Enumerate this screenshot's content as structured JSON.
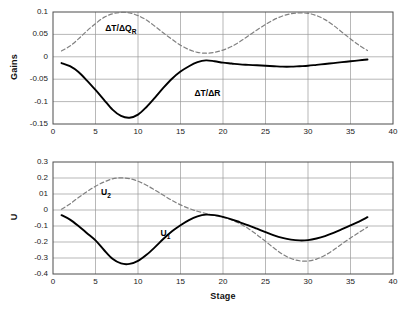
{
  "figure": {
    "background": "#ffffff",
    "grid_color": "#9a9a9a",
    "frame_color": "#4d4d4d",
    "solid_color": "#000000",
    "dashed_color": "#808080"
  },
  "chart_data": [
    {
      "type": "line",
      "panel": "top",
      "title": "",
      "xlabel": "",
      "ylabel": "Gains",
      "xlim": [
        0,
        40
      ],
      "ylim": [
        -0.15,
        0.1
      ],
      "xticks": [
        0,
        5,
        10,
        15,
        20,
        25,
        30,
        35,
        40
      ],
      "xticklabels": [
        "0",
        "5",
        "10",
        "15",
        "20",
        "25",
        "30",
        "35",
        "40"
      ],
      "yticks": [
        0.1,
        0.05,
        0,
        -0.05,
        -0.1,
        -0.15
      ],
      "yticklabels": [
        "0.1",
        "0.05",
        "0",
        "-0.05",
        "-0.1",
        "-0.15"
      ],
      "grid": true,
      "legend": "inline-annotations",
      "annotations": [
        {
          "text": "ΔT/ΔQ",
          "sub": "R",
          "x": 8.5,
          "y": 0.063
        },
        {
          "text": "ΔT/ΔR",
          "sub": "",
          "x": 19.0,
          "y": -0.082
        }
      ],
      "series": [
        {
          "name": "ΔT/ΔR",
          "style": "solid",
          "color": "#000000",
          "x": [
            1,
            2,
            3,
            4,
            5,
            6,
            7,
            8,
            9,
            10,
            11,
            12,
            13,
            14,
            15,
            16,
            17,
            18,
            19,
            20,
            21,
            22,
            23,
            24,
            25,
            26,
            27,
            28,
            29,
            30,
            31,
            32,
            33,
            34,
            35,
            36,
            37
          ],
          "y": [
            -0.014,
            -0.021,
            -0.034,
            -0.053,
            -0.074,
            -0.096,
            -0.118,
            -0.132,
            -0.136,
            -0.129,
            -0.112,
            -0.091,
            -0.069,
            -0.049,
            -0.033,
            -0.021,
            -0.012,
            -0.008,
            -0.01,
            -0.013,
            -0.015,
            -0.017,
            -0.018,
            -0.019,
            -0.02,
            -0.021,
            -0.022,
            -0.022,
            -0.021,
            -0.02,
            -0.018,
            -0.016,
            -0.014,
            -0.012,
            -0.01,
            -0.008,
            -0.006
          ]
        },
        {
          "name": "ΔT/ΔQ_R",
          "style": "dashed",
          "color": "#808080",
          "x": [
            1,
            2,
            3,
            4,
            5,
            6,
            7,
            8,
            9,
            10,
            11,
            12,
            13,
            14,
            15,
            16,
            17,
            18,
            19,
            20,
            21,
            22,
            23,
            24,
            25,
            26,
            27,
            28,
            29,
            30,
            31,
            32,
            33,
            34,
            35,
            36,
            37
          ],
          "y": [
            0.013,
            0.024,
            0.04,
            0.058,
            0.074,
            0.088,
            0.096,
            0.099,
            0.098,
            0.092,
            0.082,
            0.068,
            0.053,
            0.039,
            0.026,
            0.016,
            0.01,
            0.008,
            0.01,
            0.015,
            0.023,
            0.034,
            0.047,
            0.06,
            0.072,
            0.083,
            0.091,
            0.096,
            0.098,
            0.097,
            0.092,
            0.083,
            0.07,
            0.055,
            0.04,
            0.026,
            0.014
          ]
        }
      ]
    },
    {
      "type": "line",
      "panel": "bottom",
      "title": "",
      "xlabel": "Stage",
      "ylabel": "U",
      "xlim": [
        0,
        40
      ],
      "ylim": [
        -0.4,
        0.3
      ],
      "xticks": [
        0,
        5,
        10,
        15,
        20,
        25,
        30,
        35,
        40
      ],
      "xticklabels": [
        "0",
        "5",
        "10",
        "15",
        "20",
        "25",
        "30",
        "35",
        "40"
      ],
      "yticks": [
        0.3,
        0.2,
        0.1,
        0,
        -0.1,
        -0.2,
        -0.3,
        -0.4
      ],
      "yticklabels": [
        "0.3",
        "0.2",
        "01",
        "0",
        "-0.1",
        "-0.2",
        "-0.3",
        "-0.4"
      ],
      "grid": true,
      "legend": "inline-annotations",
      "annotations": [
        {
          "text": "U",
          "sub": "2",
          "x": 8.0,
          "y": 0.105
        },
        {
          "text": "U",
          "sub": "1",
          "x": 15.0,
          "y": -0.148
        }
      ],
      "series": [
        {
          "name": "U1",
          "style": "solid",
          "color": "#000000",
          "x": [
            1,
            2,
            3,
            4,
            5,
            6,
            7,
            8,
            9,
            10,
            11,
            12,
            13,
            14,
            15,
            16,
            17,
            18,
            19,
            20,
            21,
            22,
            23,
            24,
            25,
            26,
            27,
            28,
            29,
            30,
            31,
            32,
            33,
            34,
            35,
            36,
            37
          ],
          "y": [
            -0.032,
            -0.06,
            -0.1,
            -0.145,
            -0.19,
            -0.25,
            -0.305,
            -0.334,
            -0.337,
            -0.318,
            -0.28,
            -0.232,
            -0.18,
            -0.133,
            -0.095,
            -0.063,
            -0.04,
            -0.029,
            -0.032,
            -0.043,
            -0.058,
            -0.077,
            -0.096,
            -0.117,
            -0.138,
            -0.158,
            -0.174,
            -0.185,
            -0.19,
            -0.188,
            -0.178,
            -0.163,
            -0.143,
            -0.12,
            -0.096,
            -0.072,
            -0.045
          ]
        },
        {
          "name": "U2",
          "style": "dashed",
          "color": "#808080",
          "x": [
            1,
            2,
            3,
            4,
            5,
            6,
            7,
            8,
            9,
            10,
            11,
            12,
            13,
            14,
            15,
            16,
            17,
            18,
            19,
            20,
            21,
            22,
            23,
            24,
            25,
            26,
            27,
            28,
            29,
            30,
            31,
            32,
            33,
            34,
            35,
            36,
            37
          ],
          "y": [
            0.005,
            0.038,
            0.078,
            0.115,
            0.148,
            0.175,
            0.195,
            0.201,
            0.196,
            0.18,
            0.155,
            0.124,
            0.092,
            0.06,
            0.032,
            0.01,
            -0.008,
            -0.022,
            -0.034,
            -0.046,
            -0.062,
            -0.086,
            -0.117,
            -0.155,
            -0.196,
            -0.238,
            -0.276,
            -0.303,
            -0.317,
            -0.319,
            -0.307,
            -0.283,
            -0.25,
            -0.212,
            -0.175,
            -0.14,
            -0.107
          ]
        }
      ]
    }
  ]
}
